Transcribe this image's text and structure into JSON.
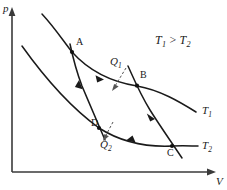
{
  "figure": {
    "type": "pv-diagram",
    "background_color": "#ffffff",
    "line_color": "#1a1a1a",
    "axis_color": "#3a3a3a",
    "heat_color": "#555555"
  },
  "axes": {
    "y_label": "p",
    "x_label": "V",
    "origin_px": [
      12,
      172
    ],
    "y_top_px": [
      12,
      10
    ],
    "x_right_px": [
      215,
      172
    ]
  },
  "relation": {
    "text_plain": "T1 > T2",
    "left_symbol": "T",
    "left_sub": "1",
    "operator": ">",
    "right_symbol": "T",
    "right_sub": "2"
  },
  "curves": [
    {
      "name": "isotherm-hot",
      "label_symbol": "T",
      "label_sub": "1",
      "kind": "isotherm",
      "temperature_rank": "higher",
      "label_px": [
        203,
        108
      ]
    },
    {
      "name": "isotherm-cold",
      "label_symbol": "T",
      "label_sub": "2",
      "kind": "isotherm",
      "temperature_rank": "lower",
      "label_px": [
        203,
        143
      ]
    },
    {
      "name": "adiabat-ab-to-c",
      "kind": "adiabat",
      "from": "B",
      "to": "C"
    },
    {
      "name": "adiabat-d-to-a",
      "kind": "adiabat",
      "from": "D",
      "to": "A"
    }
  ],
  "points": [
    {
      "id": "A",
      "label": "A",
      "px": [
        72,
        52
      ],
      "label_px": [
        76,
        41
      ]
    },
    {
      "id": "B",
      "label": "B",
      "px": [
        137,
        85
      ],
      "label_px": [
        140,
        74
      ]
    },
    {
      "id": "C",
      "label": "C",
      "px": [
        172,
        146
      ],
      "label_px": [
        168,
        150
      ]
    },
    {
      "id": "D",
      "label": "D",
      "px": [
        99,
        128
      ],
      "label_px": [
        92,
        120
      ]
    }
  ],
  "heat_flows": [
    {
      "id": "Q1",
      "symbol": "Q",
      "sub": "1",
      "direction": "into-system",
      "at_process": "A-B",
      "label_px": [
        111,
        59
      ]
    },
    {
      "id": "Q2",
      "symbol": "Q",
      "sub": "2",
      "direction": "out-of-system",
      "at_process": "C-D",
      "label_px": [
        101,
        141
      ]
    }
  ],
  "process_arrows": [
    {
      "process": "A-B",
      "on": "isotherm-hot",
      "sense": "expansion"
    },
    {
      "process": "B-C",
      "on": "adiabat-ab-to-c",
      "sense": "expansion"
    },
    {
      "process": "C-D",
      "on": "isotherm-cold",
      "sense": "compression"
    },
    {
      "process": "D-A",
      "on": "adiabat-d-to-a",
      "sense": "compression"
    }
  ]
}
